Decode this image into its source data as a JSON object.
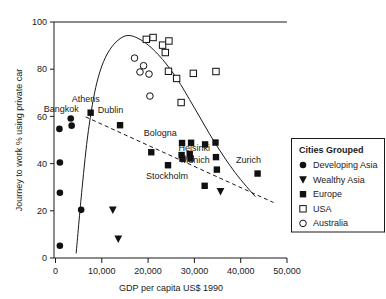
{
  "chart_data": {
    "type": "scatter",
    "title": "",
    "xlabel": "GDP per capita US$ 1990",
    "ylabel": "Journey to work % using private car",
    "xlim": [
      0,
      51500
    ],
    "ylim": [
      0,
      102
    ],
    "grid": false,
    "xticks": [
      0,
      10000,
      20000,
      30000,
      40000,
      50000
    ],
    "xticklabels": [
      "0",
      "10,000",
      "20,000",
      "30,000",
      "40,000",
      "50,000"
    ],
    "yticks": [
      0,
      20,
      40,
      60,
      80,
      100
    ],
    "yticklabels": [
      "0",
      "20",
      "40",
      "60",
      "80",
      "100"
    ],
    "legend_position": "right",
    "series": [
      {
        "name": "Developing Asia",
        "marker": "filled-circle",
        "points": [
          {
            "x": 1200,
            "y": 55.8
          },
          {
            "x": 3700,
            "y": 60.3
          },
          {
            "x": 3900,
            "y": 57.2
          },
          {
            "x": 1300,
            "y": 41.3
          },
          {
            "x": 1300,
            "y": 28.2
          },
          {
            "x": 6000,
            "y": 20.8
          },
          {
            "x": 1300,
            "y": 5.3
          }
        ]
      },
      {
        "name": "Wealthy Asia",
        "marker": "filled-triangle-down",
        "points": [
          {
            "x": 13000,
            "y": 20.8
          },
          {
            "x": 14200,
            "y": 8.3
          },
          {
            "x": 36800,
            "y": 28.8
          }
        ]
      },
      {
        "name": "Europe",
        "marker": "filled-square",
        "points": [
          {
            "x": 8100,
            "y": 62.8
          },
          {
            "x": 14600,
            "y": 57.4
          },
          {
            "x": 21500,
            "y": 45.7
          },
          {
            "x": 25200,
            "y": 40.1
          },
          {
            "x": 28300,
            "y": 49.7
          },
          {
            "x": 30300,
            "y": 49.8
          },
          {
            "x": 28200,
            "y": 44.5
          },
          {
            "x": 30000,
            "y": 44.9
          },
          {
            "x": 28400,
            "y": 42.9
          },
          {
            "x": 30200,
            "y": 43.0
          },
          {
            "x": 33400,
            "y": 49.1
          },
          {
            "x": 35700,
            "y": 49.9
          },
          {
            "x": 35800,
            "y": 43.6
          },
          {
            "x": 36000,
            "y": 38.2
          },
          {
            "x": 33300,
            "y": 31.2
          },
          {
            "x": 45000,
            "y": 36.5
          }
        ]
      },
      {
        "name": "USA",
        "marker": "open-square",
        "points": [
          {
            "x": 20400,
            "y": 94.5
          },
          {
            "x": 21900,
            "y": 95.3
          },
          {
            "x": 24000,
            "y": 92.0
          },
          {
            "x": 25400,
            "y": 93.8
          },
          {
            "x": 24600,
            "y": 88.8
          },
          {
            "x": 25300,
            "y": 80.7
          },
          {
            "x": 27100,
            "y": 77.6
          },
          {
            "x": 30800,
            "y": 79.8
          },
          {
            "x": 35800,
            "y": 80.6
          },
          {
            "x": 28100,
            "y": 67.2
          }
        ]
      },
      {
        "name": "Australia",
        "marker": "open-circle",
        "points": [
          {
            "x": 17800,
            "y": 86.4
          },
          {
            "x": 19800,
            "y": 83.1
          },
          {
            "x": 19000,
            "y": 80.4
          },
          {
            "x": 21000,
            "y": 79.5
          },
          {
            "x": 21200,
            "y": 70.0
          }
        ]
      }
    ],
    "annotations": [
      {
        "text": "Athens",
        "x": 7000,
        "y": 67.5
      },
      {
        "text": "Bangkok",
        "x": 1600,
        "y": 63.2
      },
      {
        "text": "Dublin",
        "x": 12500,
        "y": 62.5
      },
      {
        "text": "Bologna",
        "x": 23500,
        "y": 52.8
      },
      {
        "text": "Helsinki",
        "x": 31000,
        "y": 46.3
      },
      {
        "text": "Munich",
        "x": 31200,
        "y": 41.0
      },
      {
        "text": "Stockholm",
        "x": 25000,
        "y": 34.2
      },
      {
        "text": "Zurich",
        "x": 43000,
        "y": 41.0
      }
    ],
    "trend_curve_solid": {
      "description": "inverted-U fitted curve",
      "points": [
        {
          "x": 4900,
          "y": 2.0
        },
        {
          "x": 6200,
          "y": 30.0
        },
        {
          "x": 7600,
          "y": 55.0
        },
        {
          "x": 9500,
          "y": 76.0
        },
        {
          "x": 12000,
          "y": 89.0
        },
        {
          "x": 15500,
          "y": 95.8
        },
        {
          "x": 19000,
          "y": 94.5
        },
        {
          "x": 23000,
          "y": 88.0
        },
        {
          "x": 27000,
          "y": 78.0
        },
        {
          "x": 31000,
          "y": 65.0
        },
        {
          "x": 35500,
          "y": 50.0
        },
        {
          "x": 40000,
          "y": 37.0
        },
        {
          "x": 44500,
          "y": 26.5
        }
      ]
    },
    "trend_line_dashed": {
      "description": "declining linear trend",
      "start": {
        "x": 7000,
        "y": 61.0
      },
      "end": {
        "x": 48500,
        "y": 24.0
      }
    }
  },
  "legend": {
    "title": "Cities Grouped",
    "entries": [
      {
        "label": "Developing Asia",
        "marker": "filled-circle"
      },
      {
        "label": "Wealthy Asia",
        "marker": "filled-triangle-down"
      },
      {
        "label": "Europe",
        "marker": "filled-square"
      },
      {
        "label": "USA",
        "marker": "open-square"
      },
      {
        "label": "Australia",
        "marker": "open-circle"
      }
    ]
  },
  "colors": {
    "ink": "#1a1a1a",
    "marker": "#111111",
    "background": "#ffffff"
  }
}
